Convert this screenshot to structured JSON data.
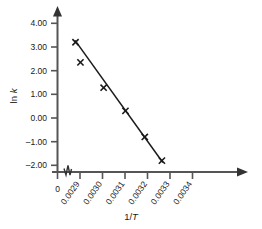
{
  "chart_data": {
    "type": "scatter",
    "title": "",
    "xlabel": "1/T",
    "ylabel": "ln k",
    "x": [
      0.00288,
      0.002902,
      0.003005,
      0.003102,
      0.003188,
      0.003264
    ],
    "values": [
      3.2,
      2.35,
      1.28,
      0.3,
      -0.8,
      -1.8
    ],
    "series": [
      {
        "name": "ln k vs 1/T",
        "x": [
          0.00288,
          0.002902,
          0.003005,
          0.003102,
          0.003188,
          0.003264
        ],
        "values": [
          3.2,
          2.35,
          1.28,
          0.3,
          -0.8,
          -1.8
        ]
      }
    ],
    "trendline": {
      "x_start": 0.002878,
      "y_start": 3.28,
      "x_end": 0.003268,
      "y_end": -1.88
    },
    "xlim": [
      0.0028485,
      0.0034575
    ],
    "ylim": [
      -2.0,
      4.0
    ],
    "xticks": [
      0.0029,
      0.003,
      0.0031,
      0.0032,
      0.0033,
      0.0034
    ],
    "xtick_labels": [
      "0.0029",
      "0.0030",
      "0.0031",
      "0.0032",
      "0.0033",
      "0.0034"
    ],
    "yticks": [
      4.0,
      3.0,
      2.0,
      1.0,
      0.0,
      -1.0,
      -2.0
    ],
    "ytick_labels": [
      "4.00",
      "3.00",
      "2.00",
      "1.00",
      "0.00",
      "–1.00",
      "–2.00"
    ],
    "origin_label": "0",
    "axis_break": true,
    "grid": false,
    "legend": "none",
    "marker": "x",
    "line_color": "#1a1a1a",
    "marker_color": "#1a1a1a",
    "axis_color": "#555555",
    "background": "#ffffff"
  },
  "axis_titles": {
    "x": "1/T",
    "x_prefix": "1/",
    "x_italic": "T",
    "y_prefix": "ln ",
    "y_italic": "k"
  }
}
